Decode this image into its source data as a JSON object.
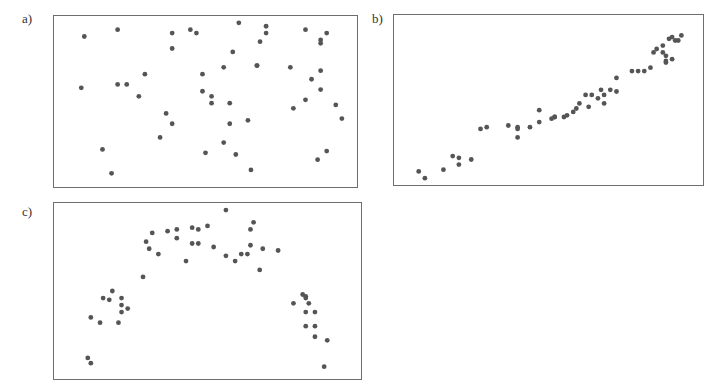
{
  "chart_data": [
    {
      "type": "scatter",
      "label": "a)",
      "title": "",
      "xlabel": "",
      "ylabel": "",
      "grid": false,
      "axis_ticks": false,
      "xlim": [
        0,
        100
      ],
      "ylim": [
        0,
        100
      ],
      "relationship": "no correlation (random scatter)",
      "points": [
        [
          10,
          88
        ],
        [
          21,
          92
        ],
        [
          9,
          58
        ],
        [
          21,
          60
        ],
        [
          24,
          60
        ],
        [
          30,
          66
        ],
        [
          28,
          53
        ],
        [
          39,
          90
        ],
        [
          45,
          92
        ],
        [
          47,
          90
        ],
        [
          39,
          81
        ],
        [
          61,
          96
        ],
        [
          59,
          79
        ],
        [
          56,
          70
        ],
        [
          49,
          66
        ],
        [
          67,
          71
        ],
        [
          49,
          56
        ],
        [
          52,
          53
        ],
        [
          52,
          49
        ],
        [
          58,
          49
        ],
        [
          70,
          94
        ],
        [
          70,
          90
        ],
        [
          68,
          85
        ],
        [
          83,
          92
        ],
        [
          90,
          90
        ],
        [
          88,
          86
        ],
        [
          88,
          84
        ],
        [
          67,
          71
        ],
        [
          78,
          70
        ],
        [
          88,
          68
        ],
        [
          85,
          63
        ],
        [
          88,
          57
        ],
        [
          83,
          51
        ],
        [
          93,
          48
        ],
        [
          79,
          46
        ],
        [
          95,
          40
        ],
        [
          64,
          39
        ],
        [
          58,
          37
        ],
        [
          39,
          37
        ],
        [
          16,
          22
        ],
        [
          19,
          8
        ],
        [
          37,
          43
        ],
        [
          35,
          29
        ],
        [
          50,
          20
        ],
        [
          56,
          26
        ],
        [
          60,
          19
        ],
        [
          65,
          10
        ],
        [
          87,
          16
        ],
        [
          90,
          21
        ]
      ]
    },
    {
      "type": "scatter",
      "label": "b)",
      "title": "",
      "xlabel": "",
      "ylabel": "",
      "grid": false,
      "axis_ticks": false,
      "xlim": [
        0,
        100
      ],
      "ylim": [
        0,
        100
      ],
      "relationship": "strong positive linear correlation",
      "points": [
        [
          8,
          8
        ],
        [
          10,
          4
        ],
        [
          16,
          9
        ],
        [
          19,
          17
        ],
        [
          21,
          16
        ],
        [
          21,
          12
        ],
        [
          25,
          15
        ],
        [
          28,
          33
        ],
        [
          30,
          34
        ],
        [
          37,
          35
        ],
        [
          40,
          34
        ],
        [
          40,
          33
        ],
        [
          40,
          28
        ],
        [
          44,
          34
        ],
        [
          47,
          37
        ],
        [
          47,
          44
        ],
        [
          51,
          39
        ],
        [
          52,
          40
        ],
        [
          52,
          40
        ],
        [
          55,
          40
        ],
        [
          56,
          41
        ],
        [
          58,
          43
        ],
        [
          59,
          45
        ],
        [
          60,
          48
        ],
        [
          62,
          53
        ],
        [
          63,
          46
        ],
        [
          64,
          53
        ],
        [
          66,
          51
        ],
        [
          67,
          56
        ],
        [
          68,
          53
        ],
        [
          68,
          48
        ],
        [
          70,
          56
        ],
        [
          72,
          63
        ],
        [
          72,
          55
        ],
        [
          77,
          67
        ],
        [
          79,
          67
        ],
        [
          81,
          67
        ],
        [
          83,
          69
        ],
        [
          84,
          78
        ],
        [
          85,
          80
        ],
        [
          87,
          82
        ],
        [
          87,
          78
        ],
        [
          88,
          76
        ],
        [
          88,
          73
        ],
        [
          88,
          72
        ],
        [
          89,
          86
        ],
        [
          90,
          87
        ],
        [
          91,
          85
        ],
        [
          90,
          74
        ],
        [
          92,
          85
        ],
        [
          93,
          88
        ]
      ]
    },
    {
      "type": "scatter",
      "label": "c)",
      "title": "",
      "xlabel": "",
      "ylabel": "",
      "grid": false,
      "axis_ticks": false,
      "xlim": [
        0,
        100
      ],
      "ylim": [
        0,
        100
      ],
      "relationship": "non-linear (inverted U / parabolic)",
      "points": [
        [
          11,
          12
        ],
        [
          12,
          9
        ],
        [
          12,
          35
        ],
        [
          15,
          32
        ],
        [
          16,
          46
        ],
        [
          18,
          45
        ],
        [
          19,
          50
        ],
        [
          21,
          32
        ],
        [
          22,
          46
        ],
        [
          22,
          42
        ],
        [
          22,
          38
        ],
        [
          24,
          40
        ],
        [
          29,
          58
        ],
        [
          30,
          78
        ],
        [
          31,
          74
        ],
        [
          32,
          83
        ],
        [
          34,
          71
        ],
        [
          37,
          84
        ],
        [
          40,
          85
        ],
        [
          40,
          80
        ],
        [
          43,
          67
        ],
        [
          45,
          86
        ],
        [
          45,
          77
        ],
        [
          47,
          85
        ],
        [
          47,
          77
        ],
        [
          50,
          87
        ],
        [
          52,
          75
        ],
        [
          56,
          96
        ],
        [
          56,
          70
        ],
        [
          59,
          67
        ],
        [
          61,
          71
        ],
        [
          63,
          71
        ],
        [
          64,
          85
        ],
        [
          64,
          76
        ],
        [
          65,
          89
        ],
        [
          68,
          74
        ],
        [
          67,
          62
        ],
        [
          73,
          73
        ],
        [
          78,
          43
        ],
        [
          81,
          48
        ],
        [
          82,
          47
        ],
        [
          82,
          46
        ],
        [
          83,
          43
        ],
        [
          82,
          38
        ],
        [
          85,
          38
        ],
        [
          82,
          30
        ],
        [
          85,
          30
        ],
        [
          85,
          24
        ],
        [
          89,
          22
        ],
        [
          88,
          7
        ]
      ]
    }
  ],
  "panels": [
    {
      "label": "a)"
    },
    {
      "label": "b)"
    },
    {
      "label": "c)"
    }
  ],
  "colors": {
    "point": "#555555",
    "frame": "#6e6e6e",
    "background": "#ffffff"
  }
}
